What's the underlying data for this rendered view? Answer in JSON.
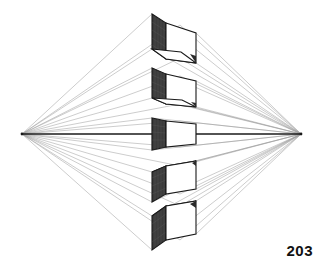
{
  "figure": {
    "page_number": "203",
    "background_color": "#ffffff",
    "ink_color": "#1a1a1a",
    "construction_line_color": "#9a9a9a",
    "shaded_face_color": "#3a3a3a",
    "light_face_color": "#ffffff",
    "horizon": {
      "label": "horizon line",
      "y": 134,
      "x_start": 22,
      "x_end": 301
    },
    "vanishing_points": [
      {
        "name": "left-vanishing-point",
        "x": 22,
        "y": 134
      },
      {
        "name": "right-vanishing-point",
        "x": 301,
        "y": 134
      }
    ],
    "boxes": [
      {
        "name": "box-top",
        "position": "far above horizon",
        "view": "underside visible",
        "front_left_x": 152,
        "front_top_y": 14,
        "front_bottom_y": 49,
        "right_x": 180,
        "depth_x": 196,
        "shaded_side": "left"
      },
      {
        "name": "box-upper",
        "position": "above horizon",
        "view": "underside visible",
        "front_left_x": 152,
        "front_top_y": 68,
        "front_bottom_y": 98,
        "right_x": 180,
        "depth_x": 196,
        "shaded_side": "left"
      },
      {
        "name": "box-horizon",
        "position": "on horizon line",
        "view": "neither top nor bottom visible",
        "front_left_x": 152,
        "front_top_y": 118,
        "front_bottom_y": 150,
        "right_x": 180,
        "depth_x": 196,
        "shaded_side": "left"
      },
      {
        "name": "box-lower",
        "position": "below horizon",
        "view": "top visible",
        "front_left_x": 152,
        "front_top_y": 172,
        "front_bottom_y": 202,
        "right_x": 180,
        "depth_x": 196,
        "shaded_side": "left"
      },
      {
        "name": "box-bottom",
        "position": "far below horizon",
        "view": "top visible",
        "front_left_x": 152,
        "front_top_y": 216,
        "front_bottom_y": 250,
        "right_x": 180,
        "depth_x": 196,
        "shaded_side": "left"
      }
    ]
  }
}
